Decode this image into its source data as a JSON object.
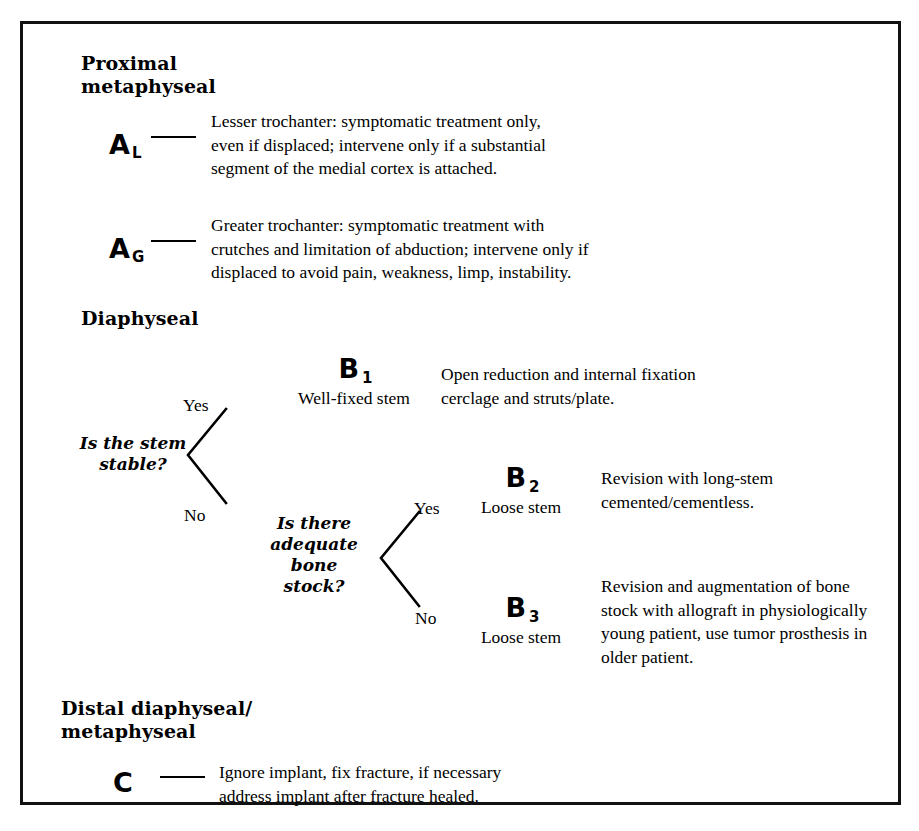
{
  "diagram": {
    "accent_color": "#000000",
    "background_color": "#ffffff",
    "border_color": "#111111"
  },
  "sections": {
    "proximal": {
      "heading": "Proximal\nmetaphyseal",
      "rows": [
        {
          "code": "A",
          "subscript": "L",
          "description": "Lesser trochanter: symptomatic treatment only,\neven if displaced; intervene only if a substantial\nsegment of the medial cortex is attached."
        },
        {
          "code": "A",
          "subscript": "G",
          "description": "Greater trochanter: symptomatic treatment with\ncrutches and limitation of abduction; intervene only if\ndisplaced to avoid pain, weakness, limp, instability."
        }
      ]
    },
    "diaphyseal": {
      "heading": "Diaphyseal",
      "question_1": "Is the stem\nstable?",
      "question_2": "Is there\nadequate\nbone\nstock?",
      "branch_yes": "Yes",
      "branch_no": "No",
      "outcomes": [
        {
          "code": "B",
          "subscript": "1",
          "stem_state": "Well-fixed stem",
          "description": "Open reduction and internal fixation\ncerclage and struts/plate."
        },
        {
          "code": "B",
          "subscript": "2",
          "stem_state": "Loose stem",
          "description": "Revision with long-stem\ncemented/cementless."
        },
        {
          "code": "B",
          "subscript": "3",
          "stem_state": "Loose stem",
          "description": "Revision and augmentation of bone\nstock with allograft in physiologically\nyoung patient, use tumor prosthesis in\nolder patient."
        }
      ]
    },
    "distal": {
      "heading": "Distal diaphyseal/\nmetaphyseal",
      "rows": [
        {
          "code": "C",
          "subscript": "",
          "description": "Ignore implant, fix fracture, if necessary\naddress implant after fracture healed."
        }
      ]
    }
  }
}
